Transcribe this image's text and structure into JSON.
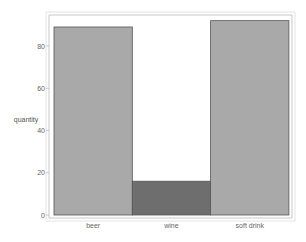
{
  "chart_data": {
    "type": "bar",
    "title": "",
    "xlabel": "",
    "ylabel": "quantity",
    "categories": [
      "beer",
      "wine",
      "soft drink"
    ],
    "values": [
      89,
      16,
      92
    ],
    "ylim": [
      0,
      96
    ],
    "yticks": [
      0,
      20,
      40,
      60,
      80
    ],
    "grid": false,
    "legend": "none",
    "colors": [
      "#a9a9a9",
      "#6e6e6e",
      "#a9a9a9"
    ],
    "edge_color": "#555555",
    "frame_color": "#c8c8c8"
  }
}
